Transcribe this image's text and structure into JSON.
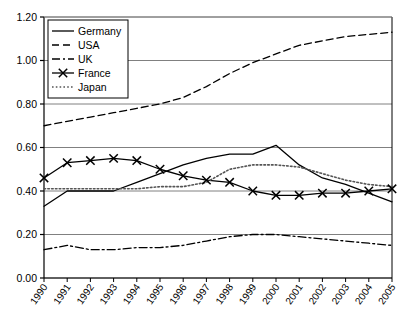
{
  "chart_data": {
    "type": "line",
    "title": "",
    "subtitle": "",
    "xlabel": "",
    "ylabel": "",
    "grid": true,
    "grid_axis": "y",
    "legend_position": "top-left-inside",
    "x": [
      "1990",
      "1991",
      "1992",
      "1993",
      "1994",
      "1995",
      "1996",
      "1997",
      "1998",
      "1999",
      "2000",
      "2001",
      "2002",
      "2003",
      "2004",
      "2005"
    ],
    "categories": [
      "1990",
      "1991",
      "1992",
      "1993",
      "1994",
      "1995",
      "1996",
      "1997",
      "1998",
      "1999",
      "2000",
      "2001",
      "2002",
      "2003",
      "2004",
      "2005"
    ],
    "ylim": [
      0.0,
      1.2
    ],
    "ytick_labels": [
      "0.00",
      "0.20",
      "0.40",
      "0.60",
      "0.80",
      "1.00",
      "1.20"
    ],
    "ytick_values": [
      0.0,
      0.2,
      0.4,
      0.6,
      0.8,
      1.0,
      1.2
    ],
    "series": [
      {
        "name": "Germany",
        "style": "solid",
        "color": "#000000",
        "marker": "none",
        "values": [
          0.33,
          0.4,
          0.4,
          0.4,
          0.44,
          0.48,
          0.52,
          0.55,
          0.57,
          0.57,
          0.61,
          0.52,
          0.46,
          0.43,
          0.39,
          0.35
        ]
      },
      {
        "name": "USA",
        "style": "dashed",
        "color": "#000000",
        "marker": "none",
        "values": [
          0.7,
          0.72,
          0.74,
          0.76,
          0.78,
          0.8,
          0.83,
          0.88,
          0.94,
          0.99,
          1.03,
          1.07,
          1.09,
          1.11,
          1.12,
          1.13
        ]
      },
      {
        "name": "UK",
        "style": "dashdot",
        "color": "#000000",
        "marker": "none",
        "values": [
          0.13,
          0.15,
          0.13,
          0.13,
          0.14,
          0.14,
          0.15,
          0.17,
          0.19,
          0.2,
          0.2,
          0.19,
          0.18,
          0.17,
          0.16,
          0.15
        ]
      },
      {
        "name": "France",
        "style": "solid",
        "color": "#000000",
        "marker": "x",
        "values": [
          0.46,
          0.53,
          0.54,
          0.55,
          0.54,
          0.5,
          0.47,
          0.45,
          0.44,
          0.4,
          0.38,
          0.38,
          0.39,
          0.39,
          0.4,
          0.41
        ]
      },
      {
        "name": "Japan",
        "style": "dotted",
        "color": "#555555",
        "marker": "none",
        "values": [
          0.41,
          0.41,
          0.41,
          0.41,
          0.41,
          0.42,
          0.42,
          0.44,
          0.5,
          0.52,
          0.52,
          0.51,
          0.48,
          0.45,
          0.43,
          0.42
        ]
      }
    ]
  },
  "legend": {
    "items": [
      {
        "label": "Germany"
      },
      {
        "label": "USA"
      },
      {
        "label": "UK"
      },
      {
        "label": "France"
      },
      {
        "label": "Japan"
      }
    ]
  },
  "axes": {
    "y_labels": [
      "1.20",
      "1.00",
      "0.80",
      "0.60",
      "0.40",
      "0.20",
      "0.00"
    ],
    "x_labels": [
      "1990",
      "1991",
      "1992",
      "1993",
      "1994",
      "1995",
      "1996",
      "1997",
      "1998",
      "1999",
      "2000",
      "2001",
      "2002",
      "2003",
      "2004",
      "2005"
    ]
  },
  "colors": {
    "background": "#ffffff",
    "axis": "#000000",
    "gridline": "#808080",
    "series_line": "#000000",
    "japan_line": "#555555"
  }
}
